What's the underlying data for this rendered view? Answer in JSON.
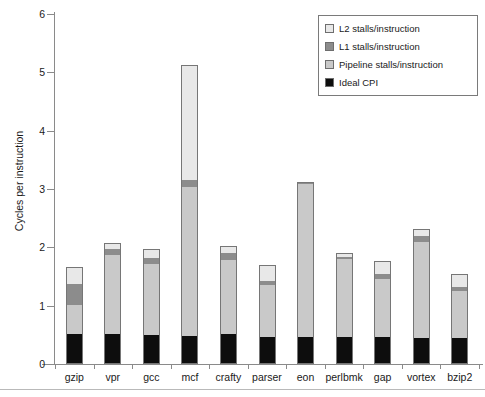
{
  "chart_data": {
    "type": "bar",
    "stacked": true,
    "title": "",
    "xlabel": "",
    "ylabel": "Cycles per instruction",
    "ylim": [
      0,
      6
    ],
    "ytick_labels": [
      "0",
      "1",
      "2",
      "3",
      "4",
      "5",
      "6"
    ],
    "yticks": [
      0,
      1,
      2,
      3,
      4,
      5,
      6
    ],
    "grid": false,
    "legend_position": "top-right",
    "categories": [
      "gzip",
      "vpr",
      "gcc",
      "mcf",
      "crafty",
      "parser",
      "eon",
      "perlbmk",
      "gap",
      "vortex",
      "bzip2"
    ],
    "series": [
      {
        "name": "Ideal CPI",
        "color": "#0d0d0d",
        "values": [
          0.5,
          0.5,
          0.48,
          0.47,
          0.49,
          0.45,
          0.45,
          0.45,
          0.44,
          0.43,
          0.43
        ]
      },
      {
        "name": "Pipeline stalls/instruction",
        "color": "#c9c9c9",
        "values": [
          0.5,
          1.35,
          1.22,
          2.55,
          1.28,
          0.88,
          2.62,
          1.33,
          1.0,
          1.65,
          0.8
        ]
      },
      {
        "name": "L1 stalls/instruction",
        "color": "#8c8c8c",
        "values": [
          0.35,
          0.1,
          0.1,
          0.11,
          0.11,
          0.08,
          0.05,
          0.03,
          0.08,
          0.09,
          0.07
        ]
      },
      {
        "name": "L2 stalls/instruction",
        "color": "#e8e8e8",
        "values": [
          0.32,
          0.13,
          0.17,
          1.99,
          0.15,
          0.29,
          0.0,
          0.1,
          0.24,
          0.15,
          0.25
        ]
      }
    ],
    "totals": [
      1.67,
      2.08,
      1.97,
      5.12,
      2.03,
      1.7,
      3.12,
      1.91,
      1.76,
      2.32,
      1.55
    ]
  },
  "legend": {
    "items": [
      {
        "label": "L2 stalls/instruction",
        "color": "#e8e8e8"
      },
      {
        "label": "L1 stalls/instruction",
        "color": "#8c8c8c"
      },
      {
        "label": "Pipeline stalls/instruction",
        "color": "#c9c9c9"
      },
      {
        "label": "Ideal CPI",
        "color": "#0d0d0d"
      }
    ]
  }
}
